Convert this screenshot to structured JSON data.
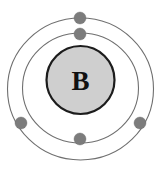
{
  "diagram": {
    "kind": "bohr-atomic-model",
    "element_symbol": "B",
    "element_name": "Boron",
    "atomic_number": 5,
    "total_electrons": 5,
    "background_color": "#ffffff",
    "nucleus": {
      "label": "B",
      "fill_color": "#cfcfcf",
      "stroke_color": "#1c1c1c",
      "center_x": 80.5,
      "center_y": 80,
      "radius": 35
    },
    "shells": [
      {
        "name": "inner-shell",
        "index": 1,
        "electron_count": 2,
        "radius_x": 58,
        "radius_y": 55,
        "center_x": 80.5,
        "center_y": 88,
        "stroke_color": "#6f6f6f"
      },
      {
        "name": "outer-shell",
        "index": 2,
        "electron_count": 3,
        "radius_x": 73,
        "radius_y": 71,
        "center_x": 80.5,
        "center_y": 89,
        "stroke_color": "#6f6f6f"
      }
    ],
    "electrons": [
      {
        "name": "electron-outer-top",
        "shell": 2,
        "cx": 80,
        "cy": 18,
        "r": 6.0,
        "color": "#7c7c7c"
      },
      {
        "name": "electron-inner-top",
        "shell": 1,
        "cx": 80,
        "cy": 34,
        "r": 6.0,
        "color": "#7c7c7c"
      },
      {
        "name": "electron-inner-left",
        "shell": 1,
        "cx": 21,
        "cy": 123,
        "r": 6.0,
        "color": "#7c7c7c"
      },
      {
        "name": "electron-inner-right",
        "shell": 1,
        "cx": 140,
        "cy": 123,
        "r": 6.0,
        "color": "#7c7c7c"
      },
      {
        "name": "electron-inner-bottom",
        "shell": 1,
        "cx": 80,
        "cy": 139,
        "r": 6.0,
        "color": "#7c7c7c"
      }
    ]
  }
}
